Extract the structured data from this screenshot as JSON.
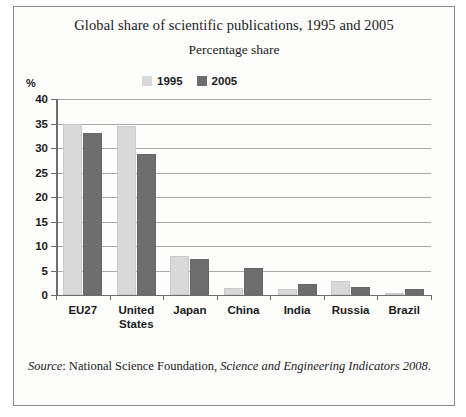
{
  "chart_data": {
    "type": "bar",
    "title": "Global share of scientific publications, 1995 and 2005",
    "subtitle": "Percentage share",
    "unit_label": "%",
    "xlabel": "",
    "ylabel": "",
    "ylim": [
      0,
      40
    ],
    "yticks": [
      0,
      5,
      10,
      15,
      20,
      25,
      30,
      35,
      40
    ],
    "grid": true,
    "legend_position": "top-center",
    "categories": [
      "EU27",
      "United States",
      "Japan",
      "China",
      "India",
      "Russia",
      "Brazil"
    ],
    "series": [
      {
        "name": "1995",
        "color": "#d9d9d9",
        "values": [
          35.0,
          34.4,
          8.0,
          1.5,
          1.3,
          2.8,
          0.3
        ]
      },
      {
        "name": "2005",
        "color": "#6e6e6e",
        "values": [
          33.0,
          28.8,
          7.4,
          5.5,
          2.2,
          1.7,
          1.2
        ]
      }
    ]
  },
  "source": {
    "lead": "Source",
    "separator": ": ",
    "publisher": "National Science Foundation, ",
    "work": "Science and Engineering Indicators 2008",
    "terminator": "."
  }
}
